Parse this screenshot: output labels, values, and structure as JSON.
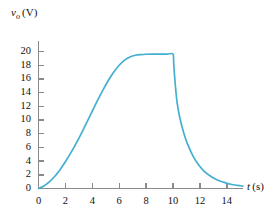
{
  "chart_data": {
    "type": "line",
    "title": "",
    "subtitle": "",
    "xlabel": "t (s)",
    "xlabel_parts": {
      "variable": "t",
      "unit": "(s)"
    },
    "ylabel": "v_o (V)",
    "ylabel_parts": {
      "variable": "v",
      "subscript": "o",
      "unit": "(V)"
    },
    "xlim": [
      0,
      15.2
    ],
    "ylim": [
      0,
      21.5
    ],
    "xticks": [
      0,
      2,
      4,
      6,
      8,
      10,
      12,
      14
    ],
    "yticks": [
      0,
      2,
      4,
      6,
      8,
      10,
      12,
      14,
      16,
      18,
      20
    ],
    "xtick_labels": [
      "0",
      "2",
      "4",
      "6",
      "8",
      "10",
      "12",
      "14"
    ],
    "ytick_labels": [
      "0",
      "2",
      "4",
      "6",
      "8",
      "10",
      "12",
      "14",
      "16",
      "18",
      "20"
    ],
    "grid": false,
    "legend": null,
    "annotations": [],
    "line_color": "#45afd0",
    "axis_color": "#8a8a8a",
    "text_color": "#111111",
    "series": [
      {
        "name": "v_o",
        "color": "#45afd0",
        "x": [
          0.0,
          0.4,
          0.8,
          1.2,
          1.6,
          2.0,
          2.4,
          2.8,
          3.2,
          3.6,
          4.0,
          4.4,
          4.8,
          5.2,
          5.6,
          6.0,
          6.4,
          6.8,
          7.2,
          7.6,
          8.0,
          8.6,
          9.2,
          9.6,
          10.0,
          10.05,
          10.15,
          10.3,
          10.5,
          10.8,
          11.1,
          11.5,
          11.9,
          12.3,
          12.8,
          13.3,
          13.8,
          14.3,
          14.8,
          15.2
        ],
        "y": [
          0.0,
          0.35,
          0.95,
          1.75,
          2.75,
          3.9,
          5.2,
          6.6,
          8.1,
          9.7,
          11.3,
          12.9,
          14.4,
          15.8,
          17.0,
          18.0,
          18.75,
          19.2,
          19.45,
          19.55,
          19.6,
          19.62,
          19.63,
          19.63,
          19.63,
          18.4,
          15.6,
          12.6,
          10.4,
          8.1,
          6.4,
          4.7,
          3.45,
          2.55,
          1.8,
          1.25,
          0.9,
          0.62,
          0.45,
          0.35
        ]
      }
    ]
  }
}
